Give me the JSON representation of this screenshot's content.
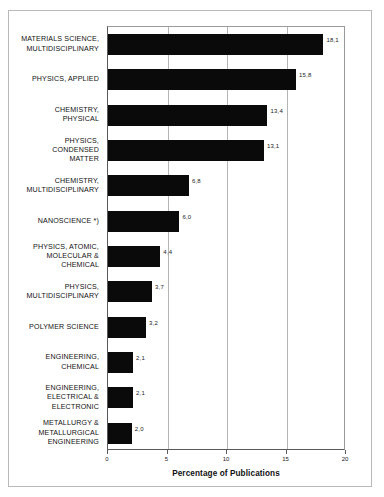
{
  "chart_data": {
    "type": "bar",
    "orientation": "horizontal",
    "title": "",
    "xlabel": "Percentage of Publications",
    "ylabel": "",
    "xlim": [
      0,
      20
    ],
    "xticks": [
      0,
      5,
      10,
      15,
      20
    ],
    "xtick_labels": [
      "0",
      "5",
      "10",
      "15",
      "20"
    ],
    "grid": true,
    "legend": null,
    "decimal_separator": ",",
    "bar_color": "#0a0a0a",
    "categories": [
      "MATERIALS SCIENCE,\nMULTIDISCIPLINARY",
      "PHYSICS, APPLIED",
      "CHEMISTRY,\nPHYSICAL",
      "PHYSICS,\nCONDENSED\nMATTER",
      "CHEMISTRY,\nMULTIDISCIPLINARY",
      "NANOSCIENCE *)",
      "PHYSICS, ATOMIC,\nMOLECULAR &\nCHEMICAL",
      "PHYSICS,\nMULTIDISCIPLINARY",
      "POLYMER SCIENCE",
      "ENGINEERING,\nCHEMICAL",
      "ENGINEERING,\nELECTRICAL &\nELECTRONIC",
      "METALLURGY &\nMETALLURGICAL\nENGINEERING"
    ],
    "values": [
      18.1,
      15.8,
      13.4,
      13.1,
      6.8,
      6.0,
      4.4,
      3.7,
      3.2,
      2.1,
      2.1,
      2.0
    ],
    "value_labels": [
      "18,1",
      "15,8",
      "13,4",
      "13,1",
      "6,8",
      "6,0",
      "4,4",
      "3,7",
      "3,2",
      "2,1",
      "2,1",
      "2,0"
    ]
  }
}
